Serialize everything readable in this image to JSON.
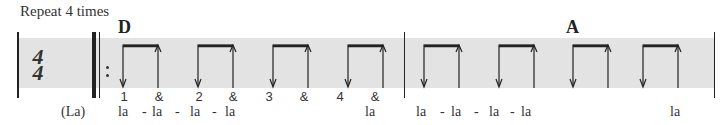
{
  "header": {
    "repeat_label": "Repeat 4 times"
  },
  "time_signature": {
    "top": "4",
    "bottom": "4"
  },
  "measures": [
    {
      "chord": "D",
      "counts": [
        "1",
        "&",
        "2",
        "&",
        "3",
        "&",
        "4",
        "&"
      ],
      "lyrics": [
        "la",
        "-",
        "la",
        "-",
        "la",
        "-",
        "la",
        "la"
      ]
    },
    {
      "chord": "A",
      "counts": [],
      "lyrics": [
        "la",
        "-",
        "la",
        "-",
        "la",
        "-",
        "la",
        "la"
      ]
    }
  ],
  "pickup_lyric": "(La)",
  "strum_pattern": [
    "down",
    "up",
    "down",
    "up",
    "down",
    "up",
    "down",
    "up"
  ],
  "colors": {
    "band": "#e3e3e3",
    "ink": "#222222"
  }
}
